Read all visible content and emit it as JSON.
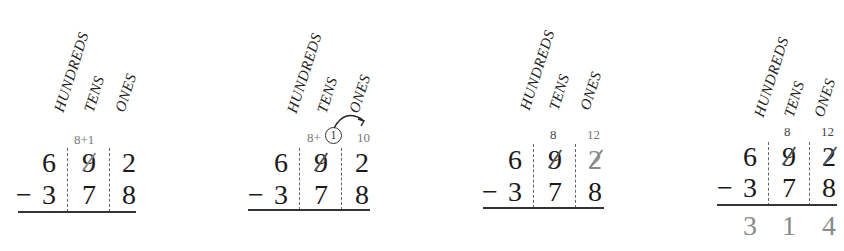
{
  "diagram": {
    "column_headers": [
      "HUNDREDS",
      "TENS",
      "ONES"
    ],
    "panels": [
      {
        "step": 1,
        "headers": {
          "hundreds": "HUNDREDS",
          "tens": "TENS",
          "ones": "ONES"
        },
        "top_annotation_tens": "8+1",
        "minuend": {
          "hundreds": "6",
          "tens": "9",
          "ones": "2"
        },
        "minus_sign": "−",
        "subtrahend": {
          "hundreds": "3",
          "tens": "7",
          "ones": "8"
        }
      },
      {
        "step": 2,
        "headers": {
          "hundreds": "HUNDREDS",
          "tens": "TENS",
          "ones": "ONES"
        },
        "top_annotation_tens_prefix": "8+",
        "top_annotation_tens_circled": "1",
        "top_annotation_ones": "10",
        "minuend": {
          "hundreds": "6",
          "tens": "9",
          "ones": "2"
        },
        "minus_sign": "−",
        "subtrahend": {
          "hundreds": "3",
          "tens": "7",
          "ones": "8"
        }
      },
      {
        "step": 3,
        "headers": {
          "hundreds": "HUNDREDS",
          "tens": "TENS",
          "ones": "ONES"
        },
        "top_annotation_tens": "8",
        "top_annotation_ones": "12",
        "minuend": {
          "hundreds": "6",
          "tens": "9",
          "ones": "2"
        },
        "minus_sign": "−",
        "subtrahend": {
          "hundreds": "3",
          "tens": "7",
          "ones": "8"
        }
      },
      {
        "step": 4,
        "headers": {
          "hundreds": "HUNDREDS",
          "tens": "TENS",
          "ones": "ONES"
        },
        "top_annotation_tens": "8",
        "top_annotation_ones": "12",
        "minuend": {
          "hundreds": "6",
          "tens": "9",
          "ones": "2"
        },
        "minus_sign": "−",
        "subtrahend": {
          "hundreds": "3",
          "tens": "7",
          "ones": "8"
        },
        "difference": {
          "hundreds": "3",
          "tens": "1",
          "ones": "4"
        }
      }
    ],
    "colors": {
      "ink": "#1a1a1a",
      "annotation_gray": "#8a8a8a",
      "rule": "#333333"
    }
  }
}
